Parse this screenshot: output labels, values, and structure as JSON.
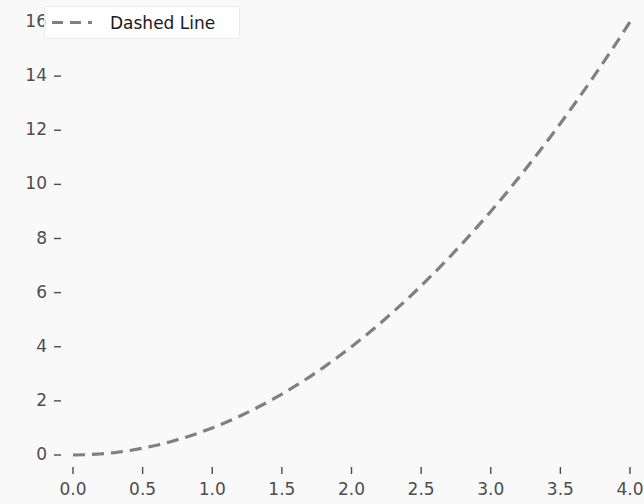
{
  "figure": {
    "background_color": "#f9f9f9",
    "width": 644,
    "height": 504
  },
  "legend": {
    "label": "Dashed Line",
    "position": "upper-left",
    "frame": true,
    "line_style": "dashed",
    "line_color": "#808080"
  },
  "axes": {
    "x_tick_labels": [
      "0.0",
      "0.5",
      "1.0",
      "1.5",
      "2.0",
      "2.5",
      "3.0",
      "3.5",
      "4.0"
    ],
    "y_tick_labels": [
      "0",
      "2",
      "4",
      "6",
      "8",
      "10",
      "12",
      "14",
      "16"
    ],
    "tick_color": "#4d4d4d"
  },
  "chart_data": {
    "type": "line",
    "title": "",
    "xlabel": "",
    "ylabel": "",
    "xlim": [
      0.0,
      4.0
    ],
    "ylim": [
      0.0,
      16.0
    ],
    "grid": false,
    "legend_position": "upper left",
    "xticks": [
      0.0,
      0.5,
      1.0,
      1.5,
      2.0,
      2.5,
      3.0,
      3.5,
      4.0
    ],
    "yticks": [
      0,
      2,
      4,
      6,
      8,
      10,
      12,
      14,
      16
    ],
    "series": [
      {
        "name": "Dashed Line",
        "color": "#808080",
        "linestyle": "dashed",
        "linewidth": 3,
        "x": [
          0.0,
          0.1,
          0.2,
          0.3,
          0.4,
          0.5,
          0.6,
          0.7,
          0.8,
          0.9,
          1.0,
          1.1,
          1.2,
          1.3,
          1.4,
          1.5,
          1.6,
          1.7,
          1.8,
          1.9,
          2.0,
          2.1,
          2.2,
          2.3,
          2.4,
          2.5,
          2.6,
          2.7,
          2.8,
          2.9,
          3.0,
          3.1,
          3.2,
          3.3,
          3.4,
          3.5,
          3.6,
          3.7,
          3.8,
          3.9,
          4.0
        ],
        "y": [
          0.0,
          0.01,
          0.04,
          0.09,
          0.16,
          0.25,
          0.36,
          0.49,
          0.64,
          0.81,
          1.0,
          1.21,
          1.44,
          1.69,
          1.96,
          2.25,
          2.56,
          2.89,
          3.24,
          3.61,
          4.0,
          4.41,
          4.84,
          5.29,
          5.76,
          6.25,
          6.76,
          7.29,
          7.84,
          8.41,
          9.0,
          9.61,
          10.24,
          10.89,
          11.56,
          12.25,
          12.96,
          13.69,
          14.44,
          15.21,
          16.0
        ]
      }
    ]
  }
}
